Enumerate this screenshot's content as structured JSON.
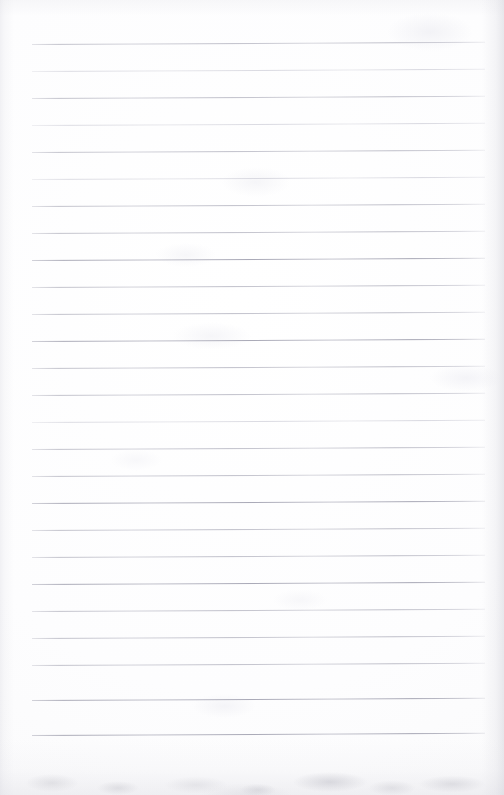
{
  "document": {
    "type": "scanned-ruled-notebook-page",
    "title": "Blank Ruled Notebook Page",
    "page_width": 504,
    "page_height": 795,
    "background_color": "#fefeff",
    "has_text_content": false,
    "text_content": "",
    "notes_count": 0
  },
  "paper": {
    "sheet_color": "#fdfdfe",
    "edge_shadow_color": "#d8d8de",
    "bottom_smudge_color": "#c4c4cb"
  },
  "ruling": {
    "style": "horizontal-ruled",
    "line_color": "#bdbdc8",
    "line_count": 26,
    "line_spacing_px": 27,
    "first_line_y": 44,
    "left_margin_x": 32,
    "right_margin_x": 485,
    "line_length_px": 453,
    "skew_degrees": -0.28,
    "lines": [
      {
        "index": 1,
        "y": 44,
        "weight": "normal"
      },
      {
        "index": 2,
        "y": 71,
        "weight": "faint"
      },
      {
        "index": 3,
        "y": 98,
        "weight": "normal"
      },
      {
        "index": 4,
        "y": 125,
        "weight": "faint"
      },
      {
        "index": 5,
        "y": 152,
        "weight": "normal"
      },
      {
        "index": 6,
        "y": 179,
        "weight": "faint"
      },
      {
        "index": 7,
        "y": 206,
        "weight": "normal"
      },
      {
        "index": 8,
        "y": 233,
        "weight": "normal"
      },
      {
        "index": 9,
        "y": 260,
        "weight": "strong"
      },
      {
        "index": 10,
        "y": 287,
        "weight": "normal"
      },
      {
        "index": 11,
        "y": 314,
        "weight": "normal"
      },
      {
        "index": 12,
        "y": 341,
        "weight": "strong"
      },
      {
        "index": 13,
        "y": 368,
        "weight": "normal"
      },
      {
        "index": 14,
        "y": 395,
        "weight": "normal"
      },
      {
        "index": 15,
        "y": 422,
        "weight": "faint"
      },
      {
        "index": 16,
        "y": 449,
        "weight": "normal"
      },
      {
        "index": 17,
        "y": 476,
        "weight": "normal"
      },
      {
        "index": 18,
        "y": 503,
        "weight": "strong"
      },
      {
        "index": 19,
        "y": 530,
        "weight": "normal"
      },
      {
        "index": 20,
        "y": 557,
        "weight": "normal"
      },
      {
        "index": 21,
        "y": 584,
        "weight": "strong"
      },
      {
        "index": 22,
        "y": 611,
        "weight": "normal"
      },
      {
        "index": 23,
        "y": 638,
        "weight": "normal"
      },
      {
        "index": 24,
        "y": 665,
        "weight": "normal"
      },
      {
        "index": 25,
        "y": 700,
        "weight": "strong"
      },
      {
        "index": 26,
        "y": 735,
        "weight": "strong"
      }
    ]
  }
}
